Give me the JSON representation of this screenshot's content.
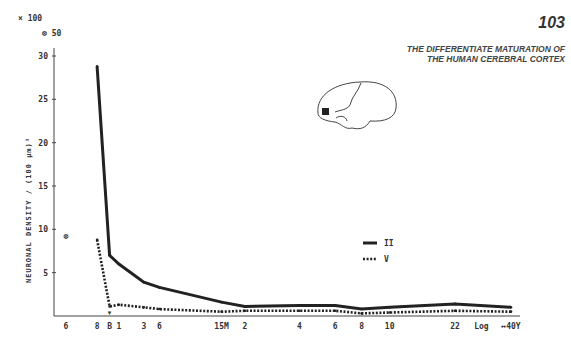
{
  "page": {
    "number": "103",
    "running_title": "THE DIFFERENTIATE MATURATION OF THE HUMAN CEREBRAL CORTEX"
  },
  "chart_data": {
    "type": "line",
    "title": "",
    "xlabel": "",
    "ylabel": "NEURONAL DENSITY / (100 µm)³",
    "y_multiplier_label": "× 100",
    "y_secondary_label": "⊗ 50",
    "ylim": [
      0,
      31
    ],
    "y_ticks": [
      5,
      10,
      15,
      20,
      25,
      30
    ],
    "x_tick_labels": [
      "6",
      "8",
      "B",
      "1",
      "3",
      "6",
      "15M",
      "2",
      "4",
      "6",
      "8",
      "10",
      "22",
      "Log",
      "↔40Y"
    ],
    "x_positions": [
      0,
      2,
      2.8,
      3.4,
      5,
      6,
      10,
      11.5,
      15,
      17.3,
      19,
      20.8,
      25,
      26.7,
      28.6
    ],
    "series": [
      {
        "name": "II",
        "style": "solid",
        "points": [
          [
            2.0,
            28.8
          ],
          [
            2.8,
            7.0
          ],
          [
            3.4,
            6.0
          ],
          [
            5.0,
            3.9
          ],
          [
            6.0,
            3.3
          ],
          [
            10.0,
            1.6
          ],
          [
            11.5,
            1.1
          ],
          [
            15.0,
            1.2
          ],
          [
            17.3,
            1.2
          ],
          [
            19.0,
            0.8
          ],
          [
            20.8,
            1.0
          ],
          [
            25.0,
            1.4
          ],
          [
            28.6,
            1.0
          ]
        ]
      },
      {
        "name": "V",
        "style": "dotted",
        "points": [
          [
            2.0,
            8.8
          ],
          [
            2.8,
            1.1
          ],
          [
            3.4,
            1.3
          ],
          [
            5.0,
            1.0
          ],
          [
            6.0,
            0.8
          ],
          [
            10.0,
            0.5
          ],
          [
            11.5,
            0.6
          ],
          [
            15.0,
            0.6
          ],
          [
            17.3,
            0.6
          ],
          [
            19.0,
            0.3
          ],
          [
            20.8,
            0.4
          ],
          [
            25.0,
            0.6
          ],
          [
            28.6,
            0.5
          ]
        ]
      }
    ],
    "outlier_point": {
      "x": 0,
      "y": 9.2,
      "label": "⊗"
    },
    "birth_marker": "▼",
    "legend": [
      {
        "label": "II",
        "style": "solid"
      },
      {
        "label": "V",
        "style": "dotted"
      }
    ],
    "legend_position": "right",
    "inset": "brain-lateral-view-with-frontal-region-marked"
  }
}
